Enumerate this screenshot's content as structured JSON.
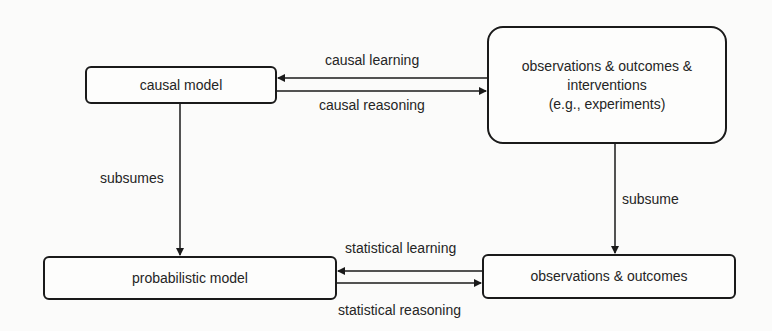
{
  "diagram": {
    "nodes": {
      "causal_model": {
        "label": "causal model"
      },
      "observations_interventions": {
        "line1": "observations & outcomes &",
        "line2": "interventions",
        "line3": "(e.g., experiments)"
      },
      "probabilistic_model": {
        "label": "probabilistic model"
      },
      "observations_outcomes": {
        "label": "observations & outcomes"
      }
    },
    "edges": {
      "causal_learning": {
        "label": "causal learning",
        "from": "observations & outcomes & interventions",
        "to": "causal model"
      },
      "causal_reasoning": {
        "label": "causal reasoning",
        "from": "causal model",
        "to": "observations & outcomes & interventions"
      },
      "subsumes": {
        "label": "subsumes",
        "from": "causal model",
        "to": "probabilistic model"
      },
      "subsume": {
        "label": "subsume",
        "from": "observations & outcomes & interventions",
        "to": "observations & outcomes"
      },
      "statistical_learning": {
        "label": "statistical learning",
        "from": "observations & outcomes",
        "to": "probabilistic model"
      },
      "statistical_reasoning": {
        "label": "statistical reasoning",
        "from": "probabilistic model",
        "to": "observations & outcomes"
      }
    }
  }
}
